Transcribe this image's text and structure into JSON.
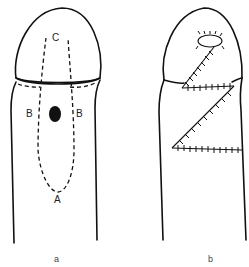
{
  "figure": {
    "panel_a": {
      "caption": "a",
      "labels": {
        "top": "C",
        "left": "B",
        "right": "B",
        "bottom": "A"
      }
    },
    "panel_b": {
      "caption": "b"
    }
  },
  "colors": {
    "line": "#111111",
    "background": "#ffffff"
  }
}
